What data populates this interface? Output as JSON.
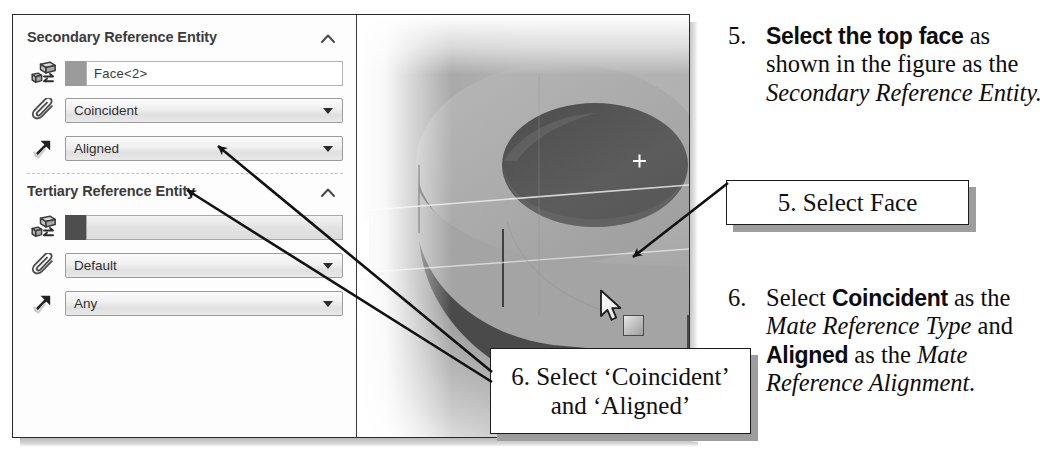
{
  "figure": {
    "panel": {
      "sections": [
        {
          "title": "Secondary Reference Entity",
          "collapse_icon": "chevron-up-icon",
          "rows": [
            {
              "icon": "reference-entity-icon",
              "type": "selection",
              "value": "Face<2>",
              "swatch": "#9b9b9b",
              "filled": false
            },
            {
              "icon": "paperclip-icon",
              "type": "combo",
              "value": "Coincident"
            },
            {
              "icon": "alignment-arrow-icon",
              "type": "combo",
              "value": "Aligned"
            }
          ]
        },
        {
          "title": "Tertiary Reference Entity",
          "collapse_icon": "chevron-up-icon",
          "rows": [
            {
              "icon": "reference-entity-icon",
              "type": "selection",
              "value": "",
              "swatch": "#4e4e4e",
              "filled": true
            },
            {
              "icon": "paperclip-icon",
              "type": "combo",
              "value": "Default"
            },
            {
              "icon": "alignment-arrow-icon",
              "type": "combo",
              "value": "Any"
            }
          ]
        }
      ]
    },
    "viewport": {
      "name": "3d-model-viewport",
      "model": "cylindrical-boss-with-through-hole",
      "cursor": "mouse-pointer",
      "cursor_badge": "face-select-badge"
    },
    "callouts": [
      {
        "id": "select-face",
        "text": "5. Select Face"
      },
      {
        "id": "select-mate",
        "line1": "6. Select ‘Coincident’",
        "line2": "and ‘Aligned’"
      }
    ]
  },
  "steps": [
    {
      "number": "5.",
      "segments": [
        {
          "text": "Select the top face",
          "style": "bold"
        },
        {
          "text": " as shown in the figure as the ",
          "style": "plain"
        },
        {
          "text": "Secondary Reference Entity",
          "style": "italic"
        },
        {
          "text": ".",
          "style": "plain"
        }
      ]
    },
    {
      "number": "6.",
      "segments": [
        {
          "text": "Select ",
          "style": "plain"
        },
        {
          "text": "Coincident",
          "style": "bold"
        },
        {
          "text": " as the ",
          "style": "plain"
        },
        {
          "text": "Mate Reference Type",
          "style": "italic"
        },
        {
          "text": " and ",
          "style": "plain"
        },
        {
          "text": "Aligned",
          "style": "bold"
        },
        {
          "text": " as the ",
          "style": "plain"
        },
        {
          "text": "Mate Reference Alignment",
          "style": "italic"
        },
        {
          "text": ".",
          "style": "plain"
        }
      ]
    }
  ],
  "colors": {
    "panel_bg": "#fdfdfd",
    "text": "#3b3b3b",
    "combo_border": "#9b9b9b",
    "callout_border": "#1c1c1c",
    "model_gray": "#a8a8a8"
  }
}
